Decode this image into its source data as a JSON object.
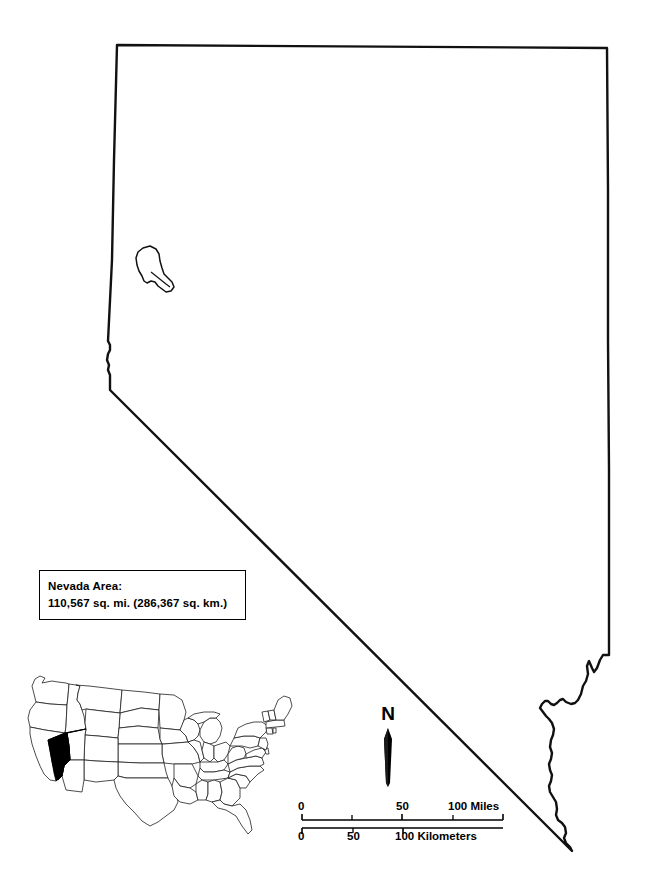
{
  "map": {
    "title": "Nevada",
    "outline_color": "#000000",
    "fill_color": "#ffffff",
    "background_color": "#ffffff"
  },
  "area_box": {
    "label": "Nevada Area:",
    "value": "110,567 sq. mi. (286,367 sq. km.)",
    "area_sq_mi": "110,567",
    "area_sq_km": "286,367",
    "border_color": "#000000"
  },
  "north_arrow": {
    "label": "N",
    "icon": "north-arrow-needle-icon"
  },
  "scale_bar": {
    "miles": {
      "unit_label": "100 Miles",
      "ticks": [
        "0",
        "50",
        "100"
      ],
      "tick_values": [
        0,
        25,
        50,
        75,
        100
      ],
      "max": 100
    },
    "kilometers": {
      "unit_label": "100 Kilometers",
      "ticks": [
        "0",
        "50",
        "100"
      ],
      "tick_values": [
        0,
        50,
        100
      ],
      "max": 160.9
    }
  },
  "inset_map": {
    "name": "united-states-locator-map",
    "highlighted_state": "Nevada",
    "highlight_color": "#000000",
    "state_outline_color": "#1a1a1a",
    "state_fill_color": "#ffffff"
  },
  "features": {
    "lake_tahoe": "Lake Tahoe border notch",
    "pyramid_lake": "Pyramid Lake",
    "lake_mead": "Lake Mead / Colorado River boundary"
  }
}
